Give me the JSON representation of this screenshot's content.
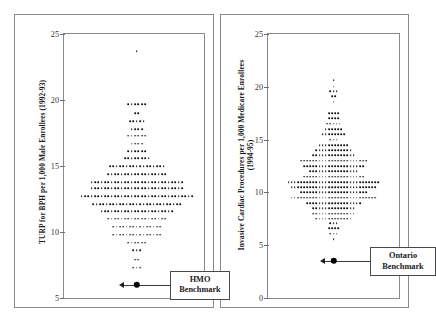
{
  "figure": {
    "panels": [
      {
        "id": "turp-bph",
        "axis_title": "TURP for BPH per 1,000 Male Enrollees (1992-93)",
        "benchmark_label": "HMO\nBenchmark",
        "benchmark_value": 6.0,
        "ticks": [
          "25",
          "20",
          "15",
          "10",
          "5"
        ],
        "chart_data": {
          "type": "scatter",
          "title": "",
          "xlabel": "",
          "ylabel": "TURP for BPH per 1,000 Male Enrollees (1992-93)",
          "ylim": [
            5,
            25
          ],
          "yticks": [
            5,
            10,
            15,
            20,
            25
          ],
          "grid": false,
          "legend": "none",
          "annotations": [
            {
              "label": "HMO Benchmark",
              "value": 6.0
            }
          ],
          "dotplot_rows": [
            {
              "value": 23.7,
              "count": 1
            },
            {
              "value": 19.7,
              "count": 6
            },
            {
              "value": 19.0,
              "count": 2
            },
            {
              "value": 18.4,
              "count": 5
            },
            {
              "value": 17.8,
              "count": 4
            },
            {
              "value": 17.3,
              "count": 6
            },
            {
              "value": 16.7,
              "count": 4
            },
            {
              "value": 16.1,
              "count": 6
            },
            {
              "value": 15.6,
              "count": 8
            },
            {
              "value": 15.0,
              "count": 17
            },
            {
              "value": 14.4,
              "count": 18
            },
            {
              "value": 13.8,
              "count": 28
            },
            {
              "value": 13.3,
              "count": 28
            },
            {
              "value": 12.7,
              "count": 34
            },
            {
              "value": 12.1,
              "count": 27
            },
            {
              "value": 11.6,
              "count": 22
            },
            {
              "value": 11.0,
              "count": 18
            },
            {
              "value": 10.4,
              "count": 15
            },
            {
              "value": 9.8,
              "count": 15
            },
            {
              "value": 9.2,
              "count": 6
            },
            {
              "value": 8.6,
              "count": 3
            },
            {
              "value": 7.9,
              "count": 2
            },
            {
              "value": 7.3,
              "count": 3
            }
          ]
        }
      },
      {
        "id": "invasive-cardiac",
        "axis_title": "Invasive Cardiac Procedures per 1,000 Medicare Enrollees\n(1994-95)",
        "benchmark_label": "Ontario\nBenchmark",
        "benchmark_value": 3.5,
        "ticks": [
          "25",
          "20",
          "15",
          "10",
          "5",
          "0"
        ],
        "chart_data": {
          "type": "scatter",
          "title": "",
          "xlabel": "",
          "ylabel": "Invasive Cardiac Procedures per 1,000 Medicare Enrollees (1994-95)",
          "ylim": [
            0,
            25
          ],
          "yticks": [
            0,
            5,
            10,
            15,
            20,
            25
          ],
          "grid": false,
          "legend": "none",
          "annotations": [
            {
              "label": "Ontario Benchmark",
              "value": 3.5
            }
          ],
          "dotplot_rows": [
            {
              "value": 20.6,
              "count": 1
            },
            {
              "value": 20.0,
              "count": 1
            },
            {
              "value": 19.6,
              "count": 3
            },
            {
              "value": 19.1,
              "count": 2
            },
            {
              "value": 18.6,
              "count": 1
            },
            {
              "value": 17.5,
              "count": 4
            },
            {
              "value": 17.0,
              "count": 4
            },
            {
              "value": 16.5,
              "count": 5
            },
            {
              "value": 16.0,
              "count": 6
            },
            {
              "value": 15.5,
              "count": 8
            },
            {
              "value": 15.0,
              "count": 3
            },
            {
              "value": 14.5,
              "count": 10
            },
            {
              "value": 14.0,
              "count": 12
            },
            {
              "value": 13.5,
              "count": 14
            },
            {
              "value": 13.0,
              "count": 22
            },
            {
              "value": 12.5,
              "count": 20
            },
            {
              "value": 12.0,
              "count": 16
            },
            {
              "value": 11.5,
              "count": 20
            },
            {
              "value": 11.0,
              "count": 30
            },
            {
              "value": 10.5,
              "count": 28
            },
            {
              "value": 10.0,
              "count": 22
            },
            {
              "value": 9.5,
              "count": 28
            },
            {
              "value": 9.0,
              "count": 18
            },
            {
              "value": 8.5,
              "count": 14
            },
            {
              "value": 8.0,
              "count": 14
            },
            {
              "value": 7.5,
              "count": 12
            },
            {
              "value": 7.1,
              "count": 3
            },
            {
              "value": 6.6,
              "count": 4
            },
            {
              "value": 6.1,
              "count": 3
            },
            {
              "value": 5.6,
              "count": 1
            }
          ]
        }
      }
    ]
  }
}
